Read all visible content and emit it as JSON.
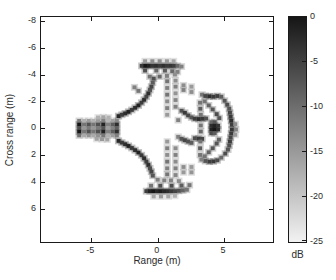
{
  "figure": {
    "background": "#ffffff"
  },
  "x_axis": {
    "label": "Range (m)",
    "ticks": [
      -5,
      0,
      5
    ],
    "range": [
      -8.8,
      8.7
    ]
  },
  "y_axis": {
    "label": "Cross range (m)",
    "ticks": [
      -8,
      -6,
      -4,
      -2,
      0,
      2,
      4,
      6
    ],
    "range": [
      -8.3,
      8.5
    ],
    "direction": "reversed"
  },
  "colorbar": {
    "label": "dB",
    "ticks": [
      0,
      -5,
      -10,
      -15,
      -20,
      -25
    ],
    "range": [
      0,
      -25
    ],
    "top_color": "#161616",
    "bottom_color": "#f2f2f2"
  },
  "chart_data": {
    "type": "heatmap",
    "xlabel": "Range (m)",
    "ylabel": "Cross range (m)",
    "colorbar_label": "dB",
    "value_range_db": [
      0,
      -25
    ],
    "xlim": [
      -8.8,
      8.7
    ],
    "ylim": [
      -8.3,
      8.5
    ],
    "grid": false,
    "points": [
      [
        -5.92,
        -0.54,
        0.52
      ],
      [
        -5.92,
        -0.27,
        0.95
      ],
      [
        -5.92,
        0,
        0.71
      ],
      [
        -5.92,
        0.27,
        0.95
      ],
      [
        -5.92,
        0.54,
        0.57
      ],
      [
        -5.55,
        -0.54,
        0.3
      ],
      [
        -5.55,
        -0.27,
        0.55
      ],
      [
        -5.55,
        0,
        0.41
      ],
      [
        -5.55,
        0.27,
        0.55
      ],
      [
        -5.55,
        0.54,
        0.33
      ],
      [
        -5.2,
        -0.54,
        0.39
      ],
      [
        -5.2,
        -0.27,
        0.7
      ],
      [
        -5.2,
        0,
        0.53
      ],
      [
        -5.2,
        0.27,
        0.7
      ],
      [
        -5.2,
        0.54,
        0.42
      ],
      [
        -4.85,
        -0.54,
        0.3
      ],
      [
        -4.85,
        -0.27,
        0.55
      ],
      [
        -4.85,
        0,
        0.41
      ],
      [
        -4.85,
        0.27,
        0.55
      ],
      [
        -4.85,
        0.54,
        0.33
      ],
      [
        -4.5,
        -0.54,
        0.39
      ],
      [
        -4.5,
        -0.27,
        0.7
      ],
      [
        -4.5,
        0,
        0.53
      ],
      [
        -4.5,
        0.27,
        0.7
      ],
      [
        -4.5,
        0.54,
        0.42
      ],
      [
        -4.1,
        -0.54,
        0.5
      ],
      [
        -4.1,
        -0.27,
        0.9
      ],
      [
        -4.1,
        0,
        0.68
      ],
      [
        -4.1,
        0.27,
        0.9
      ],
      [
        -4.1,
        0.54,
        0.54
      ],
      [
        -3.75,
        -0.54,
        0.28
      ],
      [
        -3.75,
        -0.27,
        0.5
      ],
      [
        -3.75,
        0,
        0.38
      ],
      [
        -3.75,
        0.27,
        0.5
      ],
      [
        -3.75,
        0.54,
        0.3
      ],
      [
        -3.4,
        -0.54,
        0.36
      ],
      [
        -3.4,
        -0.27,
        0.65
      ],
      [
        -3.4,
        0,
        0.49
      ],
      [
        -3.4,
        0.27,
        0.65
      ],
      [
        -3.4,
        0.54,
        0.39
      ],
      [
        -3.08,
        -0.54,
        0.47
      ],
      [
        -3.08,
        -0.27,
        0.85
      ],
      [
        -3.08,
        0,
        0.64
      ],
      [
        -3.08,
        0.27,
        0.85
      ],
      [
        -3.08,
        0.54,
        0.51
      ],
      [
        -4.5,
        -0.8,
        0.3
      ],
      [
        -4.1,
        -0.82,
        0.35
      ],
      [
        -3.7,
        -0.8,
        0.3
      ],
      [
        -4.6,
        0.8,
        0.35
      ],
      [
        -4.2,
        0.82,
        0.4
      ],
      [
        -3.8,
        0.85,
        0.35
      ],
      [
        -2.95,
        -0.9,
        0.88
      ],
      [
        -2.7,
        -1.0,
        0.78
      ],
      [
        -2.45,
        -1.1,
        0.85
      ],
      [
        -2.2,
        -1.22,
        0.9
      ],
      [
        -1.95,
        -1.36,
        0.8
      ],
      [
        -1.7,
        -1.52,
        0.85
      ],
      [
        -1.45,
        -1.7,
        0.9
      ],
      [
        -1.22,
        -1.9,
        0.78
      ],
      [
        -1.02,
        -2.12,
        0.85
      ],
      [
        -0.85,
        -2.35,
        0.75
      ],
      [
        -0.7,
        -2.6,
        0.85
      ],
      [
        -0.58,
        -2.85,
        0.7
      ],
      [
        -0.47,
        -3.1,
        0.75
      ],
      [
        -0.37,
        -3.4,
        0.65
      ],
      [
        -0.3,
        -3.7,
        0.7
      ],
      [
        -1.75,
        -3.05,
        0.5
      ],
      [
        -1.45,
        -2.78,
        0.55
      ],
      [
        -2.95,
        0.95,
        0.88
      ],
      [
        -2.7,
        1.08,
        0.8
      ],
      [
        -2.45,
        1.2,
        0.85
      ],
      [
        -2.2,
        1.33,
        0.9
      ],
      [
        -1.95,
        1.48,
        0.8
      ],
      [
        -1.7,
        1.64,
        0.85
      ],
      [
        -1.45,
        1.82,
        0.9
      ],
      [
        -1.22,
        2.02,
        0.8
      ],
      [
        -1.02,
        2.25,
        0.85
      ],
      [
        -0.85,
        2.5,
        0.78
      ],
      [
        -0.7,
        2.75,
        0.85
      ],
      [
        -0.58,
        3.0,
        0.72
      ],
      [
        -0.47,
        3.25,
        0.75
      ],
      [
        -0.37,
        3.55,
        0.68
      ],
      [
        -0.95,
        -5.0,
        0.4
      ],
      [
        -0.4,
        -5.0,
        0.45
      ],
      [
        0.15,
        -5.0,
        0.45
      ],
      [
        0.7,
        -5.0,
        0.4
      ],
      [
        1.2,
        -5.0,
        0.35
      ],
      [
        -1.2,
        -4.65,
        0.8
      ],
      [
        -0.93,
        -4.65,
        0.95
      ],
      [
        -0.66,
        -4.65,
        0.9
      ],
      [
        -0.39,
        -4.65,
        0.82
      ],
      [
        -0.12,
        -4.65,
        0.85
      ],
      [
        0.15,
        -4.65,
        0.8
      ],
      [
        0.42,
        -4.65,
        0.85
      ],
      [
        0.69,
        -4.65,
        0.8
      ],
      [
        0.96,
        -4.65,
        0.82
      ],
      [
        1.23,
        -4.65,
        0.78
      ],
      [
        1.5,
        -4.65,
        0.6
      ],
      [
        1.8,
        -4.6,
        0.5
      ],
      [
        -0.95,
        -4.3,
        0.7
      ],
      [
        -0.1,
        -4.3,
        0.6
      ],
      [
        0.55,
        -4.3,
        0.65
      ],
      [
        1.1,
        -4.25,
        0.6
      ],
      [
        1.5,
        -4.2,
        0.5
      ],
      [
        -0.6,
        -3.85,
        0.55
      ],
      [
        0.15,
        -3.85,
        0.6
      ],
      [
        0.7,
        -3.9,
        0.5
      ],
      [
        1.3,
        -4.0,
        0.45
      ],
      [
        -0.85,
        4.7,
        0.78
      ],
      [
        -0.58,
        4.7,
        0.9
      ],
      [
        -0.31,
        4.7,
        0.95
      ],
      [
        -0.04,
        4.7,
        0.88
      ],
      [
        0.23,
        4.7,
        0.92
      ],
      [
        0.5,
        4.7,
        0.88
      ],
      [
        0.77,
        4.7,
        0.85
      ],
      [
        1.04,
        4.7,
        0.8
      ],
      [
        1.31,
        4.7,
        0.75
      ],
      [
        1.6,
        4.68,
        0.7
      ],
      [
        1.9,
        4.65,
        0.62
      ],
      [
        2.2,
        4.6,
        0.55
      ],
      [
        -0.3,
        5.1,
        0.35
      ],
      [
        0.25,
        5.1,
        0.4
      ],
      [
        0.8,
        5.1,
        0.35
      ],
      [
        1.3,
        5.05,
        0.3
      ],
      [
        -0.5,
        4.3,
        0.55
      ],
      [
        0.2,
        4.3,
        0.7
      ],
      [
        1.05,
        4.3,
        0.72
      ],
      [
        1.8,
        4.28,
        0.65
      ],
      [
        2.4,
        4.25,
        0.55
      ],
      [
        0.5,
        3.9,
        0.5
      ],
      [
        1.0,
        3.9,
        0.5
      ],
      [
        1.6,
        3.95,
        0.45
      ],
      [
        0.0,
        3.85,
        0.5
      ],
      [
        0.72,
        -3.5,
        0.55
      ],
      [
        0.72,
        -3.0,
        0.5
      ],
      [
        0.72,
        -2.5,
        0.55
      ],
      [
        0.72,
        -2.0,
        0.45
      ],
      [
        0.72,
        -1.5,
        0.5
      ],
      [
        0.72,
        -1.0,
        0.4
      ],
      [
        0.72,
        1.0,
        0.4
      ],
      [
        0.72,
        1.5,
        0.5
      ],
      [
        0.72,
        2.0,
        0.45
      ],
      [
        0.72,
        2.5,
        0.55
      ],
      [
        0.72,
        3.0,
        0.5
      ],
      [
        0.72,
        3.45,
        0.55
      ],
      [
        1.35,
        -3.55,
        0.45
      ],
      [
        1.35,
        -3.1,
        0.5
      ],
      [
        1.35,
        -2.6,
        0.42
      ],
      [
        1.35,
        -2.1,
        0.48
      ],
      [
        1.35,
        -1.6,
        0.5
      ],
      [
        1.35,
        1.5,
        0.45
      ],
      [
        1.35,
        2.0,
        0.5
      ],
      [
        1.35,
        2.5,
        0.45
      ],
      [
        1.35,
        3.0,
        0.5
      ],
      [
        1.35,
        3.5,
        0.48
      ],
      [
        1.95,
        -3.2,
        0.45
      ],
      [
        1.95,
        -2.85,
        0.5
      ],
      [
        1.95,
        2.9,
        0.45
      ],
      [
        1.95,
        3.3,
        0.4
      ],
      [
        2.55,
        -3.1,
        0.4
      ],
      [
        2.55,
        -2.7,
        0.45
      ],
      [
        2.55,
        2.9,
        0.4
      ],
      [
        2.55,
        3.3,
        0.42
      ],
      [
        1.55,
        -0.6,
        0.5
      ],
      [
        1.55,
        0.65,
        0.5
      ],
      [
        1.8,
        -1.3,
        0.7
      ],
      [
        2.05,
        -1.15,
        0.8
      ],
      [
        2.3,
        -0.95,
        0.75
      ],
      [
        2.55,
        -0.8,
        0.68
      ],
      [
        2.8,
        -0.7,
        0.78
      ],
      [
        3.1,
        -0.68,
        0.85
      ],
      [
        3.4,
        -0.7,
        0.8
      ],
      [
        3.65,
        -0.72,
        0.7
      ],
      [
        1.8,
        0.8,
        0.68
      ],
      [
        2.05,
        0.9,
        0.75
      ],
      [
        2.3,
        1.0,
        0.7
      ],
      [
        2.55,
        1.1,
        0.65
      ],
      [
        2.8,
        0.75,
        0.72
      ],
      [
        3.1,
        0.78,
        0.8
      ],
      [
        3.35,
        0.8,
        0.75
      ],
      [
        3.35,
        -2.5,
        0.55
      ],
      [
        3.6,
        -2.4,
        0.75
      ],
      [
        3.9,
        -2.38,
        0.85
      ],
      [
        4.2,
        -2.35,
        0.8
      ],
      [
        4.5,
        -2.4,
        0.78
      ],
      [
        4.8,
        -2.35,
        0.65
      ],
      [
        5.05,
        -2.05,
        0.68
      ],
      [
        5.25,
        -1.75,
        0.72
      ],
      [
        5.4,
        -1.45,
        0.68
      ],
      [
        5.45,
        -1.15,
        0.75
      ],
      [
        5.5,
        -0.85,
        0.8
      ],
      [
        5.55,
        -0.55,
        0.85
      ],
      [
        5.6,
        -0.25,
        0.78
      ],
      [
        5.6,
        0.1,
        0.82
      ],
      [
        5.55,
        0.4,
        0.8
      ],
      [
        5.5,
        0.7,
        0.75
      ],
      [
        5.45,
        1.0,
        0.78
      ],
      [
        5.4,
        1.3,
        0.7
      ],
      [
        5.3,
        1.6,
        0.68
      ],
      [
        5.1,
        1.9,
        0.72
      ],
      [
        4.8,
        2.2,
        0.6
      ],
      [
        4.5,
        2.4,
        0.72
      ],
      [
        4.2,
        2.48,
        0.8
      ],
      [
        3.9,
        2.5,
        0.78
      ],
      [
        3.6,
        2.45,
        0.68
      ],
      [
        3.3,
        2.35,
        0.5
      ],
      [
        3.2,
        -1.9,
        0.55
      ],
      [
        3.22,
        -1.45,
        0.65
      ],
      [
        3.25,
        -1.0,
        0.55
      ],
      [
        3.25,
        -0.2,
        0.55
      ],
      [
        3.25,
        0.25,
        0.6
      ],
      [
        3.22,
        1.0,
        0.55
      ],
      [
        3.2,
        1.5,
        0.65
      ],
      [
        3.2,
        2.0,
        0.55
      ],
      [
        3.55,
        -2.0,
        0.55
      ],
      [
        3.85,
        -1.7,
        0.62
      ],
      [
        4.15,
        -1.4,
        0.68
      ],
      [
        4.45,
        -1.05,
        0.72
      ],
      [
        4.65,
        -0.75,
        0.68
      ],
      [
        3.55,
        2.1,
        0.55
      ],
      [
        3.85,
        1.8,
        0.62
      ],
      [
        4.15,
        1.5,
        0.68
      ],
      [
        4.45,
        1.15,
        0.68
      ],
      [
        4.62,
        0.85,
        0.62
      ],
      [
        4.05,
        -0.45,
        0.6
      ],
      [
        4.3,
        -0.45,
        0.68
      ],
      [
        4.05,
        -0.18,
        0.85
      ],
      [
        4.3,
        -0.18,
        0.9
      ],
      [
        4.55,
        -0.18,
        0.82
      ],
      [
        4.05,
        0.1,
        0.9
      ],
      [
        4.3,
        0.1,
        0.95
      ],
      [
        4.55,
        0.1,
        0.85
      ],
      [
        4.05,
        0.38,
        0.72
      ],
      [
        4.3,
        0.38,
        0.65
      ],
      [
        5.85,
        -0.3,
        0.45
      ],
      [
        5.9,
        0.1,
        0.5
      ],
      [
        5.85,
        0.5,
        0.4
      ]
    ]
  }
}
